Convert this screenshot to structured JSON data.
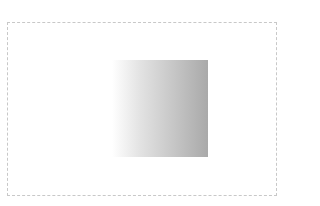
{
  "canvas": {
    "width": 284,
    "height": 206,
    "background": "#ffffff"
  },
  "frame": {
    "border_color": "#c8c8c8",
    "border_style": "dashed"
  },
  "gradient_box": {
    "direction": "to right",
    "color_start": "#ffffff",
    "color_mid": "#e2e2e2",
    "color_end": "#a9a9a9"
  }
}
